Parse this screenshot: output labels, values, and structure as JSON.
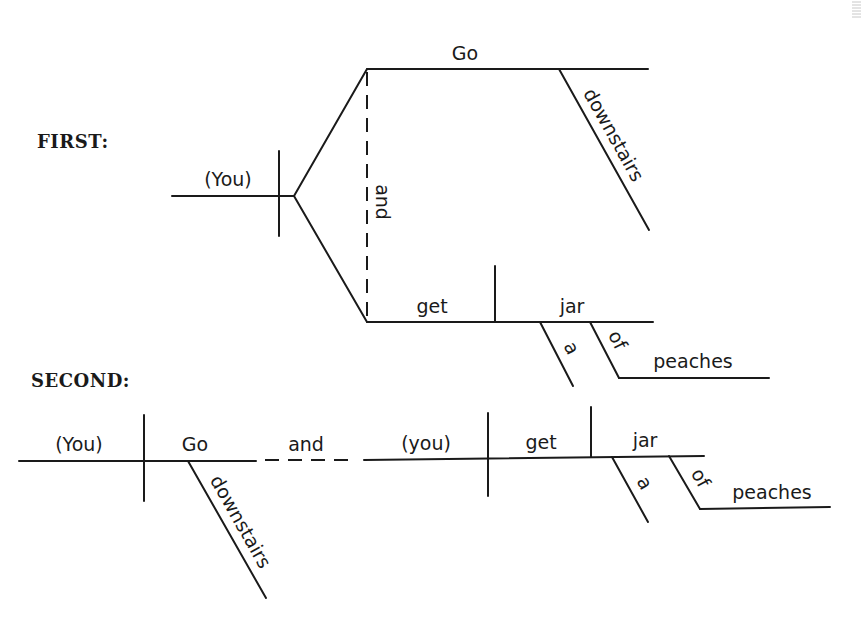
{
  "diagrams": [
    {
      "heading": "FIRST:",
      "subject": "(You)",
      "compound_predicate": {
        "conjunction": "and",
        "verb1": {
          "verb": "Go",
          "modifier": "downstairs"
        },
        "verb2": {
          "verb": "get",
          "object": "jar",
          "modifiers": [
            "a"
          ],
          "preposition": {
            "word": "of",
            "object": "peaches"
          }
        }
      }
    },
    {
      "heading": "SECOND:",
      "clause1": {
        "subject": "(You)",
        "verb": "Go",
        "modifier": "downstairs"
      },
      "conjunction": "and",
      "clause2": {
        "subject": "(you)",
        "verb": "get",
        "object": "jar",
        "modifiers": [
          "a"
        ],
        "preposition": {
          "word": "of",
          "object": "peaches"
        }
      }
    }
  ]
}
